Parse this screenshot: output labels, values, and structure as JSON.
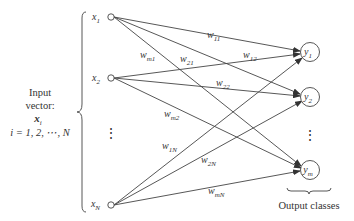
{
  "diagram": {
    "input_caption": {
      "line1": "Input",
      "line2": "vector:",
      "line3": "x",
      "line3_sub": "i",
      "line4": "i = 1, 2, ⋯, N"
    },
    "output_caption": "Output classes",
    "inputs": [
      {
        "id": "x1",
        "label": "x",
        "sub": "1"
      },
      {
        "id": "x2",
        "label": "x",
        "sub": "2"
      },
      {
        "id": "xN",
        "label": "x",
        "sub": "N"
      }
    ],
    "outputs": [
      {
        "id": "y1",
        "label": "y",
        "sub": "1"
      },
      {
        "id": "y2",
        "label": "y",
        "sub": "2"
      },
      {
        "id": "ym",
        "label": "y",
        "sub": "m"
      }
    ],
    "weights": [
      {
        "from": "x1",
        "to": "y1",
        "label": "w",
        "sub": "11"
      },
      {
        "from": "x1",
        "to": "y2",
        "label": "w",
        "sub": "21"
      },
      {
        "from": "x1",
        "to": "ym",
        "label": "w",
        "sub": "m1"
      },
      {
        "from": "x2",
        "to": "y1",
        "label": "w",
        "sub": "12"
      },
      {
        "from": "x2",
        "to": "y2",
        "label": "w",
        "sub": "22"
      },
      {
        "from": "x2",
        "to": "ym",
        "label": "w",
        "sub": "m2"
      },
      {
        "from": "xN",
        "to": "y1",
        "label": "w",
        "sub": "1N"
      },
      {
        "from": "xN",
        "to": "y2",
        "label": "w",
        "sub": "2N"
      },
      {
        "from": "xN",
        "to": "ym",
        "label": "w",
        "sub": "mN"
      }
    ],
    "ellipsis": "⋮"
  }
}
